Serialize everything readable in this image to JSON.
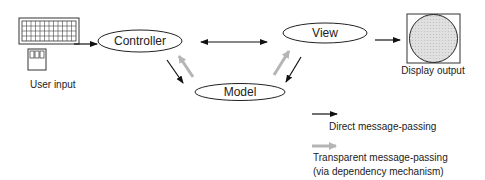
{
  "diagram": {
    "nodes": {
      "user_input": {
        "label": "User input",
        "icon": "keyboard-and-mouse-icon"
      },
      "controller": {
        "label": "Controller"
      },
      "view": {
        "label": "View"
      },
      "model": {
        "label": "Model"
      },
      "display_output": {
        "label": "Display output",
        "icon": "display-screen-icon"
      }
    },
    "edges": [
      {
        "from": "User input",
        "to": "Controller",
        "type": "direct"
      },
      {
        "from": "Controller",
        "to": "View",
        "type": "direct-bidirectional"
      },
      {
        "from": "Controller",
        "to": "Model",
        "type": "direct"
      },
      {
        "from": "Model",
        "to": "Controller",
        "type": "transparent"
      },
      {
        "from": "View",
        "to": "Model",
        "type": "direct"
      },
      {
        "from": "Model",
        "to": "View",
        "type": "transparent"
      },
      {
        "from": "View",
        "to": "Display output",
        "type": "direct"
      }
    ],
    "legend": {
      "direct": "Direct message-passing",
      "transparent_line1": "Transparent message-passing",
      "transparent_line2": "(via dependency mechanism)"
    },
    "colors": {
      "direct": "#111111",
      "transparent": "#b5b5b5",
      "display_fill": "#d9d9d9"
    }
  }
}
